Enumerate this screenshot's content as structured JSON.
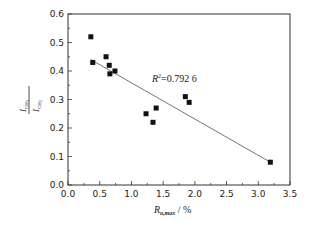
{
  "chart_data": {
    "type": "scatter",
    "title": "",
    "xlabel": "R_o,max / %",
    "ylabel": "I_CH3 / I_CH2",
    "xlim": [
      0.0,
      3.5
    ],
    "ylim": [
      0.0,
      0.6
    ],
    "xticks": [
      "0.0",
      "0.5",
      "1.0",
      "1.5",
      "2.0",
      "2.5",
      "3.0",
      "3.5"
    ],
    "yticks": [
      "0.0",
      "0.1",
      "0.2",
      "0.3",
      "0.4",
      "0.5",
      "0.6"
    ],
    "grid": false,
    "series": [
      {
        "name": "samples",
        "marker": "square",
        "x": [
          0.36,
          0.39,
          0.6,
          0.65,
          0.66,
          0.74,
          1.23,
          1.34,
          1.39,
          1.85,
          1.91,
          3.19
        ],
        "y": [
          0.52,
          0.43,
          0.45,
          0.42,
          0.39,
          0.4,
          0.25,
          0.22,
          0.27,
          0.31,
          0.29,
          0.08
        ]
      }
    ],
    "trendline": {
      "type": "linear",
      "x": [
        0.36,
        3.19
      ],
      "y": [
        0.44,
        0.08
      ]
    },
    "annotations": [
      {
        "text_r": "R",
        "text_sup": "2",
        "text_val": "=0.792 6"
      }
    ]
  },
  "labels": {
    "x_main": "R",
    "x_sub": "o,max",
    "x_unit": " / %",
    "y_num": "I",
    "y_num_sub": "CH",
    "y_num_sub2": "3",
    "y_den": "I",
    "y_den_sub": "CH",
    "y_den_sub2": "2",
    "r2_r": "R",
    "r2_sup": "2",
    "r2_val": "=0.792 6"
  }
}
